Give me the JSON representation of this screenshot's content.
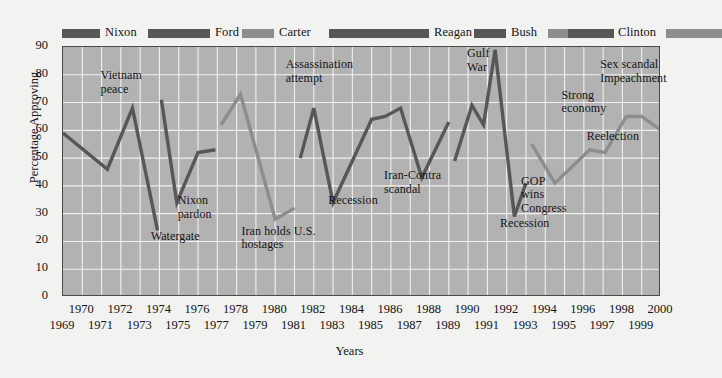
{
  "chart_data": {
    "type": "line",
    "title": "",
    "xlabel": "Years",
    "ylabel": "Percentage Approving",
    "ylim": [
      0,
      90
    ],
    "ytick_step": 10,
    "xlim": [
      1969,
      2000
    ],
    "grid": true,
    "legend_position": "top",
    "yticks": [
      "90",
      "80",
      "70",
      "60",
      "50",
      "40",
      "30",
      "20",
      "10",
      "0"
    ],
    "xticks_top_row": [
      "1970",
      "1972",
      "1974",
      "1976",
      "1978",
      "1980",
      "1982",
      "1984",
      "1986",
      "1988",
      "1990",
      "1992",
      "1994",
      "1996",
      "1998",
      "2000"
    ],
    "xticks_bottom_row": [
      "1969",
      "1971",
      "1973",
      "1975",
      "1977",
      "1979",
      "1981",
      "1983",
      "1985",
      "1987",
      "1989",
      "1991",
      "1993",
      "1995",
      "1997",
      "1999"
    ],
    "colors": {
      "republican": "#575757",
      "democrat": "#8d8d8d",
      "plot_background": "#b2b2b2",
      "gridline": "#f0f0f0",
      "frame": "#4a4a4a",
      "page_background": "#f2f2f0"
    },
    "series": [
      {
        "name": "Nixon",
        "party": "republican",
        "color": "#575757",
        "points": [
          {
            "x": 1969.0,
            "y": 59
          },
          {
            "x": 1971.3,
            "y": 46
          },
          {
            "x": 1972.6,
            "y": 68
          },
          {
            "x": 1973.9,
            "y": 24
          }
        ]
      },
      {
        "name": "Ford",
        "party": "republican",
        "color": "#575757",
        "points": [
          {
            "x": 1974.1,
            "y": 71
          },
          {
            "x": 1974.9,
            "y": 34
          },
          {
            "x": 1976.0,
            "y": 52
          },
          {
            "x": 1976.9,
            "y": 53
          }
        ]
      },
      {
        "name": "Carter",
        "party": "democrat",
        "color": "#8d8d8d",
        "points": [
          {
            "x": 1977.2,
            "y": 62
          },
          {
            "x": 1978.2,
            "y": 73
          },
          {
            "x": 1980.0,
            "y": 28
          },
          {
            "x": 1981.0,
            "y": 32
          }
        ]
      },
      {
        "name": "Reagan",
        "party": "republican",
        "color": "#575757",
        "points": [
          {
            "x": 1981.3,
            "y": 50
          },
          {
            "x": 1982.0,
            "y": 68
          },
          {
            "x": 1983.0,
            "y": 34
          },
          {
            "x": 1985.0,
            "y": 64
          },
          {
            "x": 1985.7,
            "y": 65
          },
          {
            "x": 1986.5,
            "y": 68
          },
          {
            "x": 1987.6,
            "y": 43
          },
          {
            "x": 1989.0,
            "y": 63
          }
        ]
      },
      {
        "name": "Bush",
        "party": "republican",
        "color": "#575757",
        "points": [
          {
            "x": 1989.3,
            "y": 49
          },
          {
            "x": 1990.2,
            "y": 69
          },
          {
            "x": 1990.8,
            "y": 62
          },
          {
            "x": 1991.4,
            "y": 89
          },
          {
            "x": 1992.4,
            "y": 29
          },
          {
            "x": 1993.0,
            "y": 41
          }
        ]
      },
      {
        "name": "Clinton",
        "party": "democrat",
        "color": "#8d8d8d",
        "points": [
          {
            "x": 1993.3,
            "y": 55
          },
          {
            "x": 1994.5,
            "y": 41
          },
          {
            "x": 1996.3,
            "y": 53
          },
          {
            "x": 1997.1,
            "y": 52
          },
          {
            "x": 1998.2,
            "y": 65
          },
          {
            "x": 1999.0,
            "y": 65
          },
          {
            "x": 2000.0,
            "y": 60
          }
        ]
      }
    ],
    "annotations": [
      {
        "text": "Vietnam\npeace",
        "x": 1971.0,
        "y": 78
      },
      {
        "text": "Watergate",
        "x": 1973.6,
        "y": 20
      },
      {
        "text": "Nixon\npardon",
        "x": 1975.0,
        "y": 33
      },
      {
        "text": "Iran holds U.S.\nhostages",
        "x": 1978.3,
        "y": 22
      },
      {
        "text": "Assassination\nattempt",
        "x": 1980.6,
        "y": 82
      },
      {
        "text": "Recession",
        "x": 1982.8,
        "y": 33
      },
      {
        "text": "Iran-Contra\nscandal",
        "x": 1985.7,
        "y": 42
      },
      {
        "text": "Gulf\nWar",
        "x": 1990.0,
        "y": 86
      },
      {
        "text": "Recession",
        "x": 1991.7,
        "y": 25
      },
      {
        "text": "GOP\nwins\nCongress",
        "x": 1992.8,
        "y": 40
      },
      {
        "text": "Strong\neconomy",
        "x": 1994.9,
        "y": 71
      },
      {
        "text": "Reelection",
        "x": 1996.2,
        "y": 56
      },
      {
        "text": "Sex scandal\nImpeachment",
        "x": 1996.9,
        "y": 82
      }
    ],
    "legend_bar": [
      {
        "label": "Nixon",
        "party": "republican",
        "bar_left": 0,
        "bar_width": 38,
        "label_left": 40
      },
      {
        "label": "Ford",
        "party": "republican",
        "bar_left": 86,
        "bar_width": 62,
        "label_left": 150
      },
      {
        "label": "Carter",
        "party": "democrat",
        "bar_left": 180,
        "bar_width": 32,
        "label_left": 214
      },
      {
        "label": "Reagan",
        "party": "republican",
        "bar_left": 267,
        "bar_width": 100,
        "label_left": 369
      },
      {
        "label": "Bush",
        "party": "republican",
        "bar_left": 412,
        "bar_width": 32,
        "label_left": 446
      },
      {
        "label": "Clinton",
        "party": "democrat",
        "bar_left": 486,
        "bar_width": 20,
        "label_left": 553
      },
      {
        "label": "",
        "party": "republican",
        "bar_left": 506,
        "bar_width": 46,
        "label_left": 0
      },
      {
        "label": "",
        "party": "democrat",
        "bar_left": 604,
        "bar_width": 56,
        "label_left": 0
      }
    ]
  }
}
